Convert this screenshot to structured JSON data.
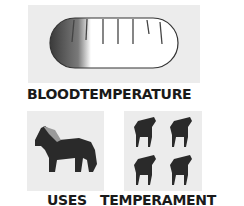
{
  "sections": {
    "blood_temperature": {
      "label": "BLOODTEMPERATURE",
      "icon": "thermometer-pill-icon"
    },
    "uses": {
      "label": "USES",
      "icon": "draft-horse-icon"
    },
    "temperament": {
      "label": "TEMPERAMENT",
      "icon": "four-horses-icon"
    }
  },
  "colors": {
    "panel": "#ececec",
    "text": "#1a1a1a",
    "shape": "#2a2a2a"
  }
}
